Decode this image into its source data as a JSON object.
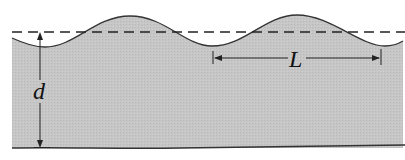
{
  "diagram": {
    "labels": {
      "depth": "d",
      "wavelength": "L"
    },
    "colors": {
      "water": "#c4c4c4",
      "line": "#222222",
      "background": "#ffffff"
    },
    "elements": [
      {
        "id": "still-water-level",
        "type": "dashed-line"
      },
      {
        "id": "wave-surface",
        "type": "sinusoid",
        "crests": 2
      },
      {
        "id": "depth-arrow",
        "label": "d"
      },
      {
        "id": "wavelength-arrow",
        "label": "L"
      },
      {
        "id": "seabed",
        "type": "bottom-line"
      }
    ]
  }
}
